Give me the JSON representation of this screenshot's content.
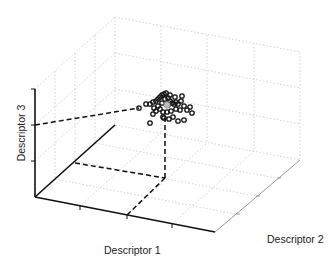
{
  "chart_data": {
    "type": "scatter",
    "dimensions": 3,
    "title": "",
    "xlabel": "Descriptor 1",
    "ylabel": "Descriptor 2",
    "zlabel": "Descriptor 3",
    "grid": true,
    "grid_style": "dotted",
    "legend": null,
    "tick_labels_shown": false,
    "marker": "open-circle",
    "marker_color": "#000000",
    "centroid_marker": "gray-filled-circle",
    "projection_lines": "dashed",
    "points_screen_px": [
      [
        139,
        108
      ],
      [
        146,
        104
      ],
      [
        150,
        104
      ],
      [
        153,
        102
      ],
      [
        156,
        101
      ],
      [
        158,
        99
      ],
      [
        160,
        97
      ],
      [
        162,
        95
      ],
      [
        164,
        94
      ],
      [
        166,
        93
      ],
      [
        165,
        99
      ],
      [
        168,
        98
      ],
      [
        170,
        101
      ],
      [
        172,
        103
      ],
      [
        174,
        104
      ],
      [
        176,
        102
      ],
      [
        178,
        104
      ],
      [
        181,
        101
      ],
      [
        184,
        106
      ],
      [
        190,
        107
      ],
      [
        192,
        113
      ],
      [
        187,
        110
      ],
      [
        180,
        110
      ],
      [
        176,
        109
      ],
      [
        171,
        111
      ],
      [
        167,
        112
      ],
      [
        163,
        112
      ],
      [
        160,
        109
      ],
      [
        156,
        111
      ],
      [
        153,
        114
      ],
      [
        150,
        123
      ],
      [
        163,
        117
      ],
      [
        169,
        119
      ],
      [
        173,
        117
      ],
      [
        178,
        121
      ],
      [
        184,
        120
      ],
      [
        158,
        106
      ],
      [
        154,
        108
      ],
      [
        162,
        103
      ],
      [
        175,
        97
      ],
      [
        182,
        96
      ],
      [
        168,
        105
      ],
      [
        170,
        95
      ],
      [
        164,
        118
      ]
    ],
    "centroid_screen_px": [
      167,
      105
    ]
  }
}
